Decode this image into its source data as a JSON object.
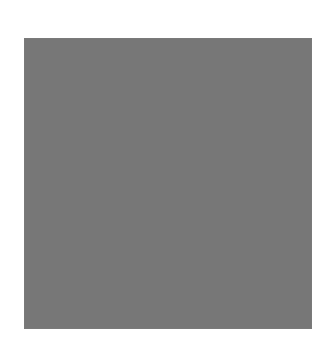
{
  "game": {
    "rows": 18,
    "cols": 18,
    "colors": {
      "light": "#b4b4b4",
      "dark": "#9c9c9c",
      "grid_line": "#767676"
    },
    "clues": {
      "top": [
        "L",
        "D",
        "L",
        "D",
        "L",
        "D",
        "L",
        "D",
        "L",
        "L",
        "D",
        "L",
        "D",
        "L",
        "D",
        "L",
        "D",
        "L"
      ],
      "bottom": [
        "L",
        "D",
        "L",
        "D",
        "L",
        "D",
        "L",
        "D",
        "L",
        "L",
        "D",
        "L",
        "D",
        "L",
        "D",
        "L",
        "D",
        "L"
      ],
      "left": [
        "L",
        "D",
        "L",
        "D",
        "L",
        "D",
        "L",
        "D",
        "L",
        "L",
        "D",
        "L",
        "D",
        "L",
        "D",
        "L",
        "D",
        "L"
      ],
      "right": [
        "L",
        "D",
        "L",
        "D",
        "L",
        "D",
        "L",
        "D",
        "L",
        "L",
        "D",
        "L",
        "D",
        "L",
        "D",
        "L",
        "D",
        "L"
      ]
    },
    "grid": [
      "LLLLLLLLLLDLDLDLDL",
      "DDDDDDDDDLDLDLDLDL",
      "LLLLLLLLLLDLDLDLDL",
      "DDDDDDDDDLDLDLDLDL",
      "LLLLLLLLLLDLDLDLDL",
      "DDDDDDDDDLDLDLDLDL",
      "LLLLLLLLLLDLDLDLDL",
      "DDDDDDDDDLDLDLDLDL",
      "LLLLLLLLLLDLDLDLDL",
      "LDLDLDLDLLLLLLLLLL",
      "LDLDLDLDLDDDDDDDDD",
      "LDLDLDLDLLLLLLLLLL",
      "LDLDLDLDLDDDDDDDDD",
      "LDLDLDLDLLLLLLLLLL",
      "LDLDLDLDLDDDDDDDDD",
      "LDLDLDLDLLLLLLLLLL",
      "LDLDLDLDLDDDDDDDDD",
      "LDLDLDLDLLLLLLLLLL"
    ]
  }
}
